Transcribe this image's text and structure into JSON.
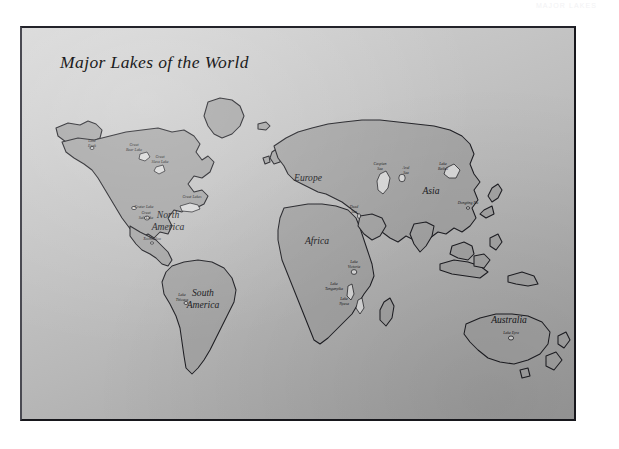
{
  "page": {
    "running_head": "MAJOR LAKES"
  },
  "map": {
    "title": "Major Lakes of the World",
    "continents": [
      {
        "name": "North America",
        "line1": "North",
        "line2": "America"
      },
      {
        "name": "South America",
        "line1": "South",
        "line2": "America"
      },
      {
        "name": "Europe",
        "line1": "Europe",
        "line2": ""
      },
      {
        "name": "Africa",
        "line1": "Africa",
        "line2": ""
      },
      {
        "name": "Asia",
        "line1": "Asia",
        "line2": ""
      },
      {
        "name": "Australia",
        "line1": "Australia",
        "line2": ""
      }
    ],
    "lakes": [
      {
        "name": "Lake Eyak",
        "line1": "Lake",
        "line2": "Eyak"
      },
      {
        "name": "Great Bear Lake",
        "line1": "Great",
        "line2": "Bear Lake"
      },
      {
        "name": "Great Slave Lake",
        "line1": "Great",
        "line2": "Slave Lake"
      },
      {
        "name": "Great Lakes",
        "line1": "Great Lakes",
        "line2": ""
      },
      {
        "name": "Crater Lake",
        "line1": "Crater Lake",
        "line2": ""
      },
      {
        "name": "Great Salt Lake",
        "line1": "Great",
        "line2": "Salt Lake"
      },
      {
        "name": "Xochimilco",
        "line1": "Xochimilco",
        "line2": ""
      },
      {
        "name": "Lake Titicaca",
        "line1": "Lake",
        "line2": "Titicaca"
      },
      {
        "name": "Caspian Sea",
        "line1": "Caspian",
        "line2": "Sea"
      },
      {
        "name": "Aral Sea",
        "line1": "Aral",
        "line2": "Sea"
      },
      {
        "name": "Dead Sea",
        "line1": "Dead",
        "line2": "Sea"
      },
      {
        "name": "Lake Baikal",
        "line1": "Lake",
        "line2": "Baikal"
      },
      {
        "name": "Dongting Hu",
        "line1": "Dongting Hu",
        "line2": ""
      },
      {
        "name": "Lake Victoria",
        "line1": "Lake",
        "line2": "Victoria"
      },
      {
        "name": "Lake Tanganyika",
        "line1": "Lake",
        "line2": "Tanganyika"
      },
      {
        "name": "Lake Nyasa",
        "line1": "Lake",
        "line2": "Nyasa"
      },
      {
        "name": "Lake Eyre",
        "line1": "Lake Eyre",
        "line2": ""
      }
    ],
    "colors": {
      "land": "#a5a5a5",
      "outline": "#1d1d22",
      "lake": "#d9d9d9",
      "background_light": "#d8d8d8",
      "background_dark": "#9e9e9e",
      "text": "#16161a"
    }
  }
}
